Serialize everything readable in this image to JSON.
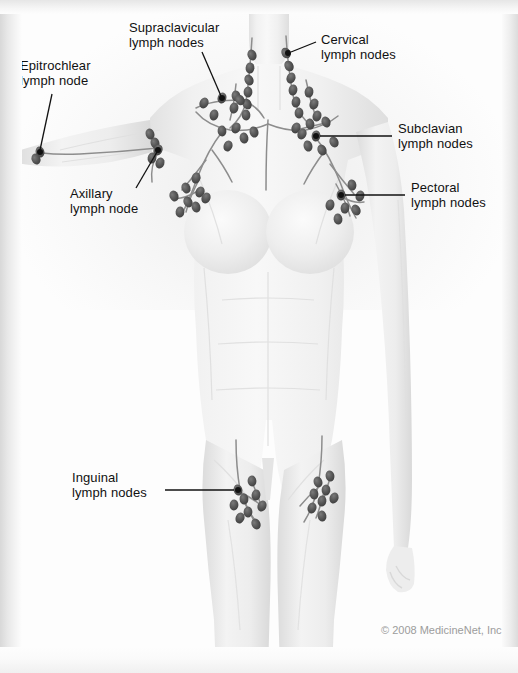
{
  "figure": {
    "width": 518,
    "height": 673,
    "style": "grayscale medical illustration",
    "node_color": "#5b5b5b",
    "vessel_color": "#8f8f8f",
    "leader_color": "#111111",
    "body_color": "#f2f2f2"
  },
  "labels": [
    {
      "id": "epitrochlear",
      "name": "epitrochlear-label",
      "line1": "Epitrochlear",
      "line2": "lymph node",
      "x": 20,
      "y": 58,
      "leader": {
        "x1": 52,
        "y1": 94,
        "x2": 40,
        "y2": 150,
        "dot_x": 40,
        "dot_y": 152
      }
    },
    {
      "id": "supraclavicular",
      "name": "supraclavicular-label",
      "line1": "Supraclavicular",
      "line2": "lymph nodes",
      "x": 129,
      "y": 20,
      "leader": {
        "x1": 202,
        "y1": 52,
        "x2": 221,
        "y2": 96,
        "dot_x": 222,
        "dot_y": 98
      }
    },
    {
      "id": "cervical",
      "name": "cervical-label",
      "line1": "Cervical",
      "line2": "lymph nodes",
      "x": 321,
      "y": 32,
      "leader": {
        "x1": 316,
        "y1": 42,
        "x2": 291,
        "y2": 52,
        "dot_x": 288,
        "dot_y": 53
      }
    },
    {
      "id": "subclavian",
      "name": "subclavian-label",
      "line1": "Subclavian",
      "line2": "lymph nodes",
      "x": 398,
      "y": 121,
      "leader": {
        "x1": 392,
        "y1": 136,
        "x2": 320,
        "y2": 136,
        "dot_x": 316,
        "dot_y": 136
      }
    },
    {
      "id": "pectoral",
      "name": "pectoral-label",
      "line1": "Pectoral",
      "line2": "lymph nodes",
      "x": 411,
      "y": 180,
      "leader": {
        "x1": 405,
        "y1": 195,
        "x2": 345,
        "y2": 195,
        "dot_x": 341,
        "dot_y": 195
      }
    },
    {
      "id": "axillary",
      "name": "axillary-label",
      "line1": "Axillary",
      "line2": "lymph node",
      "x": 70,
      "y": 186,
      "leader": {
        "x1": 136,
        "y1": 188,
        "x2": 157,
        "y2": 152,
        "dot_x": 158,
        "dot_y": 150
      }
    },
    {
      "id": "inguinal",
      "name": "inguinal-label",
      "line1": "Inguinal",
      "line2": "lymph nodes",
      "x": 72,
      "y": 470,
      "leader": {
        "x1": 165,
        "y1": 490,
        "x2": 234,
        "y2": 490,
        "dot_x": 238,
        "dot_y": 490
      }
    }
  ],
  "credit": {
    "text": "© 2008 MedicineNet, Inc.",
    "x": 381,
    "y": 624
  },
  "nodes": {
    "cervical_right_chain": [
      [
        286,
        53
      ],
      [
        289,
        66
      ],
      [
        291,
        78
      ],
      [
        293,
        90
      ],
      [
        296,
        102
      ],
      [
        299,
        113
      ],
      [
        309,
        92
      ],
      [
        314,
        104
      ],
      [
        317,
        116
      ]
    ],
    "cervical_left_chain": [
      [
        252,
        55
      ],
      [
        250,
        68
      ],
      [
        249,
        80
      ],
      [
        248,
        92
      ],
      [
        247,
        104
      ],
      [
        246,
        115
      ],
      [
        236,
        96
      ],
      [
        234,
        108
      ]
    ],
    "supraclavicular_left": [
      [
        204,
        103
      ],
      [
        222,
        98
      ],
      [
        240,
        100
      ],
      [
        214,
        115
      ]
    ],
    "supraclavicular_right": [
      [
        310,
        124
      ],
      [
        326,
        122
      ],
      [
        296,
        128
      ]
    ],
    "subclavian_right": [
      [
        316,
        136
      ],
      [
        302,
        134
      ],
      [
        308,
        146
      ],
      [
        322,
        150
      ],
      [
        334,
        142
      ]
    ],
    "subclavian_left": [
      [
        222,
        131
      ],
      [
        236,
        128
      ],
      [
        244,
        138
      ],
      [
        228,
        146
      ],
      [
        254,
        132
      ]
    ],
    "pectoral_right": [
      [
        341,
        195
      ],
      [
        345,
        208
      ],
      [
        338,
        219
      ],
      [
        352,
        185
      ],
      [
        360,
        196
      ],
      [
        356,
        210
      ],
      [
        330,
        205
      ]
    ],
    "pectoral_left": [
      [
        196,
        178
      ],
      [
        186,
        188
      ],
      [
        200,
        192
      ],
      [
        188,
        202
      ],
      [
        180,
        212
      ],
      [
        196,
        207
      ],
      [
        206,
        198
      ],
      [
        174,
        196
      ]
    ],
    "axillary_left": [
      [
        155,
        143
      ],
      [
        158,
        150
      ],
      [
        152,
        158
      ],
      [
        160,
        163
      ],
      [
        150,
        134
      ]
    ],
    "epitrochlear_left": [
      [
        40,
        152
      ],
      [
        36,
        159
      ]
    ],
    "inguinal_left": [
      [
        238,
        490
      ],
      [
        244,
        499
      ],
      [
        234,
        505
      ],
      [
        248,
        512
      ],
      [
        240,
        518
      ],
      [
        256,
        495
      ],
      [
        252,
        481
      ],
      [
        262,
        506
      ],
      [
        256,
        524
      ]
    ],
    "inguinal_right": [
      [
        318,
        482
      ],
      [
        326,
        490
      ],
      [
        314,
        494
      ],
      [
        322,
        501
      ],
      [
        330,
        476
      ],
      [
        312,
        508
      ],
      [
        322,
        516
      ],
      [
        334,
        498
      ]
    ]
  }
}
